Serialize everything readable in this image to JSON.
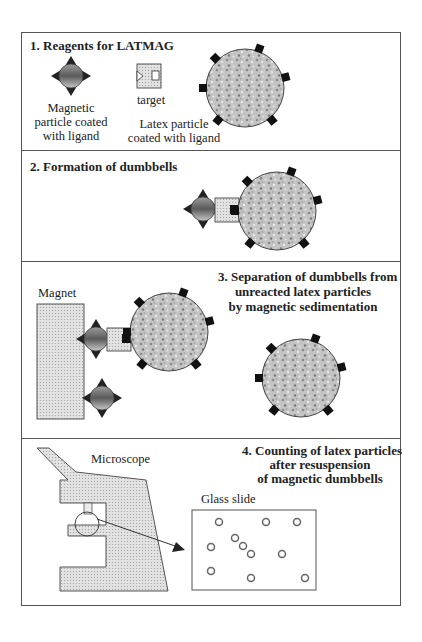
{
  "diagram": {
    "panels": [
      {
        "title": "1. Reagents for LATMAG",
        "labels": {
          "magnetic_particle": [
            "Magnetic",
            "particle coated",
            "with ligand"
          ],
          "target": "target",
          "latex_particle": [
            "Latex particle",
            "coated with ligand"
          ]
        }
      },
      {
        "title": "2. Formation of dumbbells"
      },
      {
        "title_lines": [
          "3. Separation of dumbbells from",
          "unreacted latex particles",
          "by magnetic sedimentation"
        ],
        "labels": {
          "magnet": "Magnet"
        }
      },
      {
        "title_lines": [
          "4. Counting of latex particles",
          "after resuspension",
          "of magnetic dumbbells"
        ],
        "labels": {
          "microscope": "Microscope",
          "glass_slide": "Glass slide"
        }
      }
    ],
    "colors": {
      "frame": "#555555",
      "latex_fill": "#bdbdbd",
      "ligand": "#111111",
      "target_fill": "#d8d8d8",
      "magnetic_dark": "#5a5a5a",
      "magnetic_light": "#b8b8b8",
      "microscope_fill": "#dcdcdc"
    }
  }
}
